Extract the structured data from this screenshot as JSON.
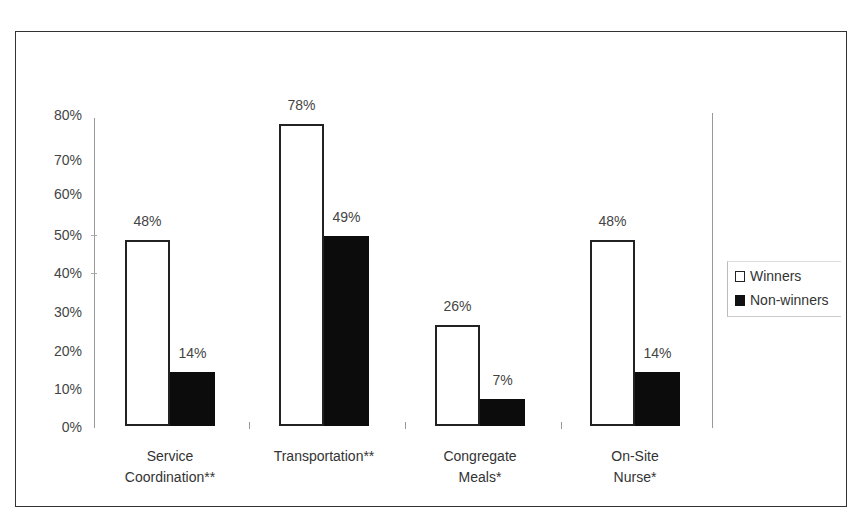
{
  "chart_data": {
    "type": "bar",
    "title": "",
    "xlabel": "",
    "ylabel": "",
    "ylim": [
      0,
      80
    ],
    "yticks": [
      "0%",
      "10%",
      "20%",
      "30%",
      "40%",
      "50%",
      "60%",
      "70%",
      "80%"
    ],
    "categories": [
      "Service\nCoordination**",
      "Transportation**",
      "Congregate\nMeals*",
      "On-Site\nNurse*"
    ],
    "series": [
      {
        "name": "Winners",
        "values": [
          48,
          78,
          26,
          48
        ],
        "labels": [
          "48%",
          "78%",
          "26%",
          "48%"
        ],
        "color": "#ffffff"
      },
      {
        "name": "Non-winners",
        "values": [
          14,
          49,
          7,
          14
        ],
        "labels": [
          "14%",
          "49%",
          "7%",
          "14%"
        ],
        "color": "#0c0c0c"
      }
    ],
    "legend_position": "right",
    "grid": false
  },
  "legend": {
    "items": [
      {
        "label": "Winners"
      },
      {
        "label": "Non-winners"
      }
    ]
  }
}
